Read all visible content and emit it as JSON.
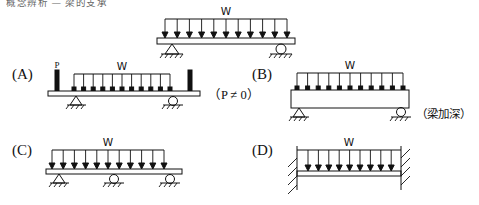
{
  "page": {
    "cut_header_text": "概念辨析 — 梁的支承",
    "background": "#ffffff",
    "ink_color": "#111111"
  },
  "reference_figure": {
    "name": "reference-beam",
    "load_label": "W",
    "load_type": "uniformly-distributed",
    "arrow_count": 11,
    "left_support": "pin",
    "right_support": "roller",
    "beam_depth": "shallow"
  },
  "options": [
    {
      "key": "A",
      "label": "(A)",
      "load_label": "W",
      "point_load_label": "P",
      "arrow_count": 11,
      "left_support": "pin",
      "right_support": "roller",
      "beam_depth": "shallow",
      "note": "（P ≠ 0）",
      "note_is_cjk": false,
      "description": "simply supported beam with UDL plus end point loads P"
    },
    {
      "key": "B",
      "label": "(B)",
      "load_label": "W",
      "arrow_count": 11,
      "left_support": "pin",
      "right_support": "roller",
      "beam_depth": "deep",
      "note": "（梁加深）",
      "note_is_cjk": true,
      "description": "simply supported deepened beam with UDL"
    },
    {
      "key": "C",
      "label": "(C)",
      "load_label": "W",
      "arrow_count": 11,
      "left_support": "pin",
      "middle_support": "roller",
      "right_support": "roller",
      "beam_depth": "shallow",
      "note": "",
      "note_is_cjk": false,
      "description": "two-span continuous beam with UDL"
    },
    {
      "key": "D",
      "label": "(D)",
      "load_label": "W",
      "arrow_count": 10,
      "left_support": "fixed-wall",
      "right_support": "fixed-wall",
      "beam_depth": "shallow",
      "note": "",
      "note_is_cjk": false,
      "description": "fixed-fixed beam with UDL"
    }
  ]
}
